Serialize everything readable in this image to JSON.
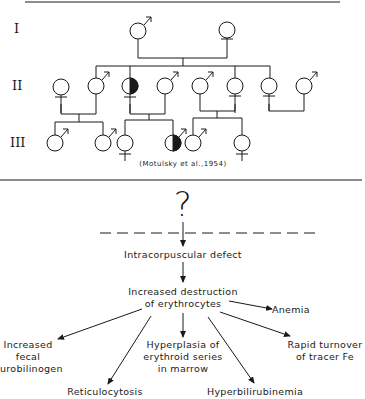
{
  "pedigree": {
    "generations": [
      "I",
      "II",
      "III"
    ],
    "citation": "(Motulsky et al.,1954)",
    "legend_note": "half-filled symbols denote affected carriers",
    "generation_I": [
      {
        "sex": "male",
        "affected": false
      },
      {
        "sex": "female",
        "affected": false
      }
    ],
    "generation_II": [
      {
        "sex": "female",
        "affected": false
      },
      {
        "sex": "male",
        "affected": false
      },
      {
        "sex": "female",
        "affected": true
      },
      {
        "sex": "male",
        "affected": false
      },
      {
        "sex": "male",
        "affected": false
      },
      {
        "sex": "female",
        "affected": false
      },
      {
        "sex": "female",
        "affected": false
      },
      {
        "sex": "male",
        "affected": false
      }
    ],
    "generation_III": [
      {
        "sex": "male",
        "affected": false
      },
      {
        "sex": "male",
        "affected": false
      },
      {
        "sex": "female",
        "affected": false
      },
      {
        "sex": "male",
        "affected": true
      },
      {
        "sex": "male",
        "affected": false
      },
      {
        "sex": "female",
        "affected": false
      }
    ]
  },
  "flow": {
    "unknown": "?",
    "defect": "Intracorpuscular defect",
    "destruction_line1": "Increased destruction",
    "destruction_line2": "of erythrocytes",
    "outcomes": {
      "anemia": "Anemia",
      "tracer": [
        "Rapid turnover",
        "of tracer Fe"
      ],
      "fecal": [
        "Increased",
        "fecal",
        "urobilinogen"
      ],
      "hyperplasia": [
        "Hyperplasia of",
        "erythroid series",
        "in marrow"
      ],
      "reticulocytosis": "Reticulocytosis",
      "hyperbilirubinemia": "Hyperbilirubinemia"
    }
  }
}
